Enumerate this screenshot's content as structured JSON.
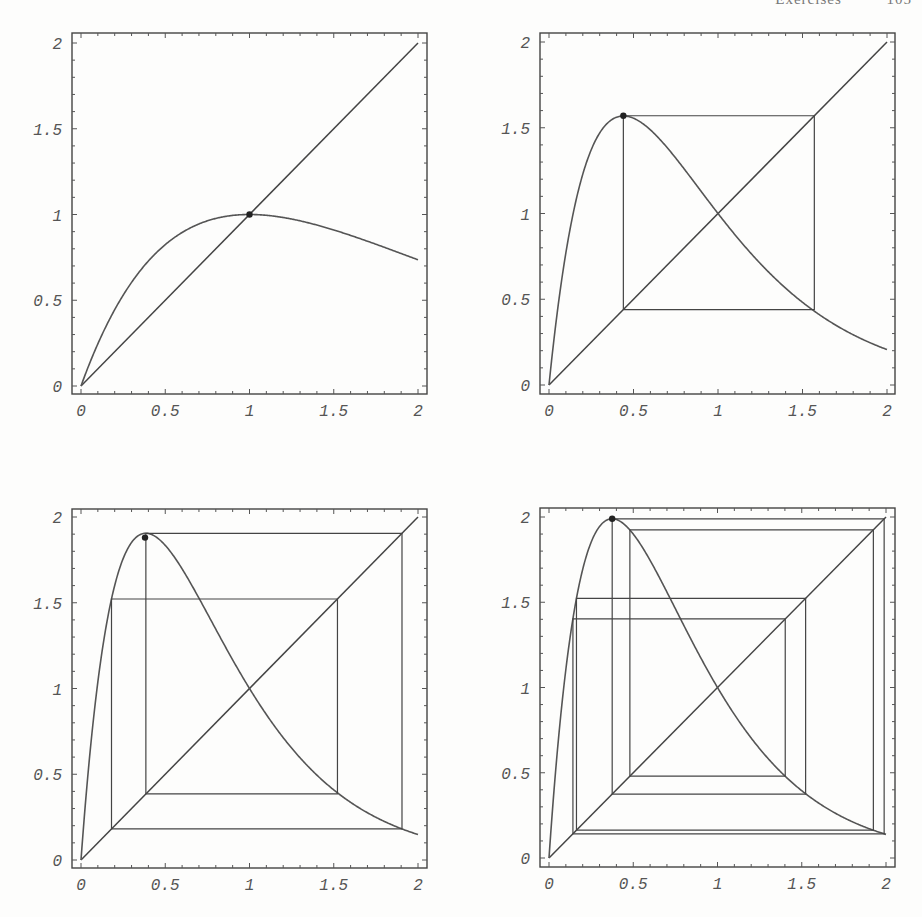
{
  "header": {
    "left": "Exercises",
    "right": "105"
  },
  "chart_data": [
    {
      "type": "line",
      "title": "",
      "function": "f(x) = x*exp(r*(1-x))",
      "r": 1.0,
      "xlim": [
        0,
        2
      ],
      "ylim": [
        0,
        2
      ],
      "xticks": [
        "0",
        "0.5",
        "1",
        "1.5",
        "2"
      ],
      "yticks": [
        "0",
        "0.5",
        "1",
        "1.5",
        "2"
      ],
      "series": [
        {
          "name": "curve",
          "x": [
            0,
            0.25,
            0.5,
            0.75,
            1.0,
            1.25,
            1.5,
            1.75,
            2.0
          ],
          "y": [
            0,
            0.53,
            0.82,
            0.96,
            1.0,
            0.97,
            0.91,
            0.83,
            0.74
          ]
        },
        {
          "name": "diagonal",
          "x": [
            0,
            2
          ],
          "y": [
            0,
            2
          ]
        }
      ],
      "marked_point": [
        1.0,
        1.0
      ],
      "cobweb_orbit": []
    },
    {
      "type": "line",
      "title": "",
      "function": "f(x) = x*exp(r*(1-x))",
      "r": 2.27,
      "xlim": [
        0,
        2
      ],
      "ylim": [
        0,
        2
      ],
      "xticks": [
        "0",
        "0.5",
        "1",
        "1.5",
        "2"
      ],
      "yticks": [
        "0",
        "0.5",
        "1",
        "1.5",
        "2"
      ],
      "series": [
        {
          "name": "curve",
          "x": [
            0,
            0.25,
            0.44,
            0.75,
            1.0,
            1.25,
            1.5,
            1.75,
            2.0
          ],
          "y": [
            0,
            1.41,
            1.57,
            1.35,
            1.0,
            0.71,
            0.48,
            0.32,
            0.21
          ]
        },
        {
          "name": "diagonal",
          "x": [
            0,
            2
          ],
          "y": [
            0,
            2
          ]
        }
      ],
      "marked_point": [
        0.44,
        1.57
      ],
      "cobweb_orbit": [
        0.44,
        1.57
      ]
    },
    {
      "type": "line",
      "title": "",
      "function": "f(x) = x*exp(r*(1-x))",
      "r": 2.6,
      "xlim": [
        0,
        2
      ],
      "ylim": [
        0,
        2
      ],
      "xticks": [
        "0",
        "0.5",
        "1",
        "1.5",
        "2"
      ],
      "yticks": [
        "0",
        "0.5",
        "1",
        "1.5",
        "2"
      ],
      "series": [
        {
          "name": "curve",
          "x": [
            0,
            0.19,
            0.38,
            0.75,
            1.0,
            1.25,
            1.53,
            1.75,
            2.0
          ],
          "y": [
            0,
            1.53,
            1.88,
            1.32,
            1.0,
            0.65,
            0.39,
            0.25,
            0.15
          ]
        },
        {
          "name": "diagonal",
          "x": [
            0,
            2
          ],
          "y": [
            0,
            2
          ]
        }
      ],
      "marked_point": [
        0.38,
        1.88
      ],
      "cobweb_orbit": [
        0.385,
        1.905,
        0.181,
        1.522
      ]
    },
    {
      "type": "line",
      "title": "",
      "function": "f(x) = x*exp(r*(1-x))",
      "r": 2.67,
      "xlim": [
        0,
        2
      ],
      "ylim": [
        0,
        2
      ],
      "xticks": [
        "0",
        "0.5",
        "1",
        "1.5",
        "2"
      ],
      "yticks": [
        "0",
        "0.5",
        "1",
        "1.5",
        "2"
      ],
      "series": [
        {
          "name": "curve",
          "x": [
            0,
            0.15,
            0.375,
            0.75,
            1.0,
            1.25,
            1.5,
            1.75,
            2.0
          ],
          "y": [
            0,
            1.46,
            1.99,
            1.46,
            1.0,
            0.64,
            0.39,
            0.24,
            0.14
          ]
        },
        {
          "name": "diagonal",
          "x": [
            0,
            2
          ],
          "y": [
            0,
            2
          ]
        }
      ],
      "marked_point": [
        0.375,
        1.99
      ],
      "cobweb_orbit": [
        0.375,
        1.989,
        0.142,
        1.402,
        0.48,
        1.925,
        0.163,
        1.523
      ]
    }
  ]
}
